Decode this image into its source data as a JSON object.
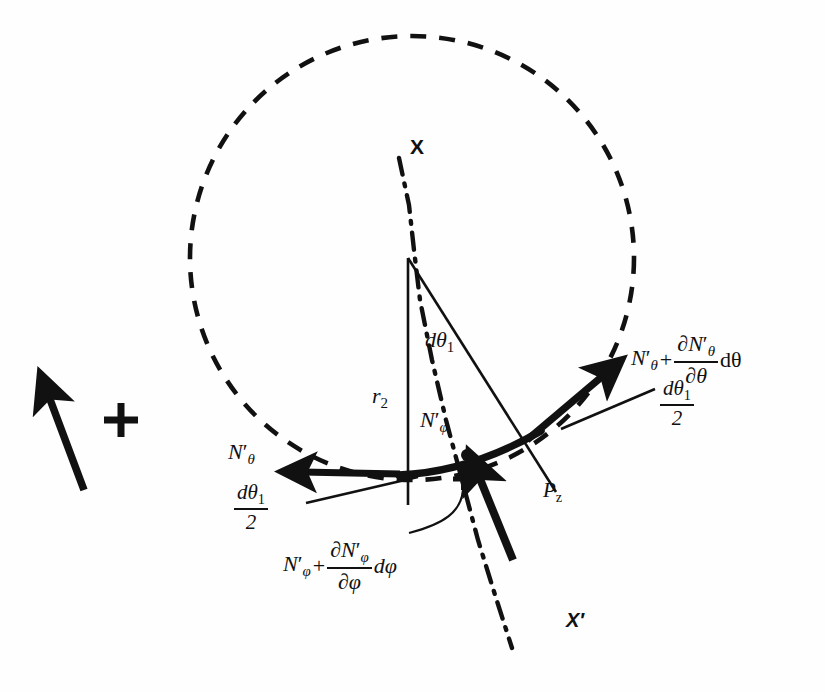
{
  "figure": {
    "background_color": "#fefefe",
    "ink_color": "#111111",
    "width": 826,
    "height": 693
  },
  "labels": {
    "axis_x": "X",
    "axis_x_prime": "X′",
    "radius": {
      "base": "r",
      "sub": "2"
    },
    "angle_increment": {
      "base": "dθ",
      "sub": "1"
    },
    "meridional_force": {
      "base": "N",
      "prime": "′",
      "sub": "φ"
    },
    "hoop_force": {
      "base": "N",
      "prime": "′",
      "sub": "θ"
    },
    "half_angle": {
      "numerator_base": "dθ",
      "numerator_sub": "1",
      "denominator": "2"
    },
    "hoop_force_incremented": {
      "first_term_base": "N",
      "first_term_prime": "′",
      "first_term_sub": "θ",
      "operator": "+",
      "fraction_numerator_partial": "∂N",
      "fraction_numerator_prime": "′",
      "fraction_numerator_sub": "θ",
      "fraction_denominator_partial": "∂θ",
      "trailing_differential": "dθ"
    },
    "meridional_force_incremented": {
      "first_term_base": "N",
      "first_term_prime": "′",
      "first_term_sub": "φ",
      "operator": "+",
      "fraction_numerator_partial": "∂N",
      "fraction_numerator_prime": "′",
      "fraction_numerator_sub": "φ",
      "fraction_denominator_partial": "∂φ",
      "trailing_differential": "dφ"
    },
    "pressure": {
      "base": "P",
      "sub": "z"
    }
  },
  "geometry": {
    "circle": {
      "cx": 412,
      "cy": 258,
      "r": 222,
      "style": "dashed"
    },
    "apex": {
      "x": 408,
      "y": 258
    },
    "vertical_radius_line": {
      "x1": 408,
      "y1": 258,
      "x2": 408,
      "y2": 505
    },
    "slant_radius_line": {
      "x1": 408,
      "y1": 258,
      "x2": 556,
      "y2": 492
    },
    "shell_arc": {
      "start_x": 406,
      "start_y": 474,
      "end_x": 540,
      "end_y": 432
    },
    "axis_line": {
      "x1": 398,
      "y1": 160,
      "x2": 520,
      "y2": 640,
      "style": "dash-dot"
    }
  },
  "markers": {
    "center_dot": {
      "x": 467,
      "y": 455,
      "label": "dot-marker"
    },
    "plus_marker": {
      "x": 463,
      "y": 478,
      "label": "plus-marker"
    },
    "legend_arrow": {
      "x1": 85,
      "y1": 490,
      "x2": 48,
      "y2": 392,
      "label": "legend-arrow"
    },
    "legend_plus": {
      "x": 120,
      "y": 420,
      "label": "legend-plus"
    }
  },
  "arrows": [
    {
      "name": "hoop-force-left-arrow",
      "x1": 398,
      "y1": 474,
      "x2": 297,
      "y2": 472,
      "weight": "thick"
    },
    {
      "name": "hoop-force-right-arrow",
      "x1": 530,
      "y1": 437,
      "x2": 608,
      "y2": 371,
      "weight": "thick"
    },
    {
      "name": "pressure-arrow",
      "x1": 512,
      "y1": 558,
      "x2": 477,
      "y2": 472,
      "weight": "thick"
    }
  ],
  "leaders": [
    {
      "name": "leader-left-half-angle",
      "x1": 306,
      "y1": 503,
      "x2": 415,
      "y2": 477
    },
    {
      "name": "leader-right-half-angle",
      "x1": 563,
      "y1": 428,
      "x2": 652,
      "y2": 390
    },
    {
      "name": "leader-meridional-curve",
      "x1": 463,
      "y1": 488,
      "x2": 413,
      "y2": 530
    }
  ]
}
